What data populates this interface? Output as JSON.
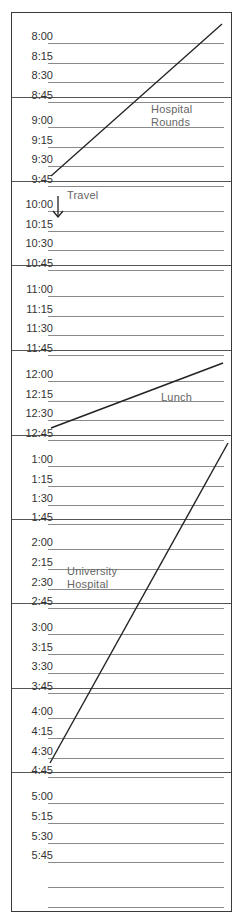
{
  "planner": {
    "sections": [
      {
        "hour": "8",
        "slots": [
          "8:00",
          "8:15",
          "8:30",
          "8:45"
        ]
      },
      {
        "hour": "9",
        "slots": [
          "9:00",
          "9:15",
          "9:30",
          "9:45"
        ]
      },
      {
        "hour": "10",
        "slots": [
          "10:00",
          "10:15",
          "10:30",
          "10:45"
        ]
      },
      {
        "hour": "11",
        "slots": [
          "11:00",
          "11:15",
          "11:30",
          "11:45"
        ]
      },
      {
        "hour": "12",
        "slots": [
          "12:00",
          "12:15",
          "12:30",
          "12:45"
        ]
      },
      {
        "hour": "1",
        "slots": [
          "1:00",
          "1:15",
          "1:30",
          "1:45"
        ]
      },
      {
        "hour": "2",
        "slots": [
          "2:00",
          "2:15",
          "2:30",
          "2:45"
        ]
      },
      {
        "hour": "3",
        "slots": [
          "3:00",
          "3:15",
          "3:30",
          "3:45"
        ]
      },
      {
        "hour": "4",
        "slots": [
          "4:00",
          "4:15",
          "4:30",
          "4:45"
        ]
      },
      {
        "hour": "5",
        "slots": [
          "5:00",
          "5:15",
          "5:30",
          "5:45",
          "",
          ""
        ]
      }
    ],
    "entries": [
      {
        "label_line1": "Hospital",
        "label_line2": "Rounds",
        "start": "8:00",
        "end": "9:45",
        "mark": "diagonal-line"
      },
      {
        "label_line1": "Travel",
        "start": "10:00",
        "end": "10:15",
        "mark": "down-arrow"
      },
      {
        "label_line1": "Lunch",
        "start": "12:00",
        "end": "12:45",
        "mark": "diagonal-line"
      },
      {
        "label_line1": "University",
        "label_line2": "Hospital",
        "start": "1:00",
        "end": "4:45",
        "mark": "diagonal-line"
      }
    ],
    "colors": {
      "ink": "#222222",
      "rule": "#8a8a8a",
      "frame": "#3a3a3a",
      "note": "#666666"
    }
  }
}
